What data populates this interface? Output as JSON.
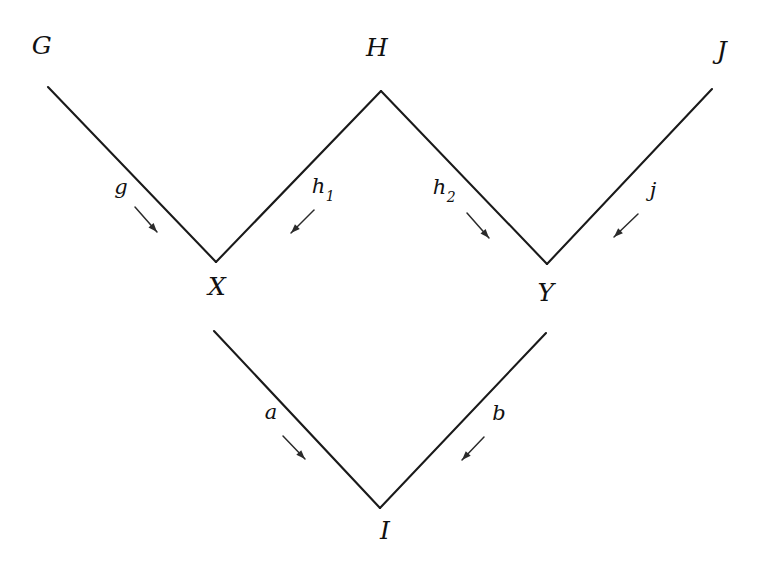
{
  "diagram": {
    "background_color": "#ffffff",
    "line_color": "#1a1a1a",
    "text_color": "#111111",
    "nodes": [
      {
        "id": "G",
        "label": "G",
        "x": 42,
        "y": 45
      },
      {
        "id": "H",
        "label": "H",
        "x": 377,
        "y": 47
      },
      {
        "id": "J",
        "label": "J",
        "x": 722,
        "y": 50
      },
      {
        "id": "X",
        "label": "X",
        "x": 217,
        "y": 286
      },
      {
        "id": "Y",
        "label": "Y",
        "x": 546,
        "y": 292
      },
      {
        "id": "I",
        "label": "I",
        "x": 385,
        "y": 530
      }
    ],
    "edges": [
      {
        "id": "g",
        "label": "g",
        "sublabel": "",
        "from": "G",
        "to": "X",
        "x1": 48,
        "y1": 87,
        "x2": 216,
        "y2": 262,
        "label_x": 121,
        "label_y": 187,
        "arrow_x1": 135,
        "arrow_y1": 207,
        "arrow_x2": 157,
        "arrow_y2": 232
      },
      {
        "id": "h1",
        "label": "h",
        "sublabel": "1",
        "from": "H",
        "to": "X",
        "x1": 381,
        "y1": 91,
        "x2": 216,
        "y2": 262,
        "label_x": 323,
        "label_y": 188,
        "arrow_x1": 314,
        "arrow_y1": 210,
        "arrow_x2": 291,
        "arrow_y2": 233
      },
      {
        "id": "h2",
        "label": "h",
        "sublabel": "2",
        "from": "H",
        "to": "Y",
        "x1": 381,
        "y1": 91,
        "x2": 547,
        "y2": 264,
        "label_x": 444,
        "label_y": 189,
        "arrow_x1": 467,
        "arrow_y1": 213,
        "arrow_x2": 489,
        "arrow_y2": 238
      },
      {
        "id": "j",
        "label": "j",
        "sublabel": "",
        "from": "J",
        "to": "Y",
        "x1": 712,
        "y1": 89,
        "x2": 547,
        "y2": 264,
        "label_x": 653,
        "label_y": 190,
        "arrow_x1": 638,
        "arrow_y1": 214,
        "arrow_x2": 614,
        "arrow_y2": 237
      },
      {
        "id": "a",
        "label": "a",
        "sublabel": "",
        "from": "X",
        "to": "I",
        "x1": 214,
        "y1": 331,
        "x2": 380,
        "y2": 508,
        "label_x": 271,
        "label_y": 412,
        "arrow_x1": 283,
        "arrow_y1": 436,
        "arrow_x2": 305,
        "arrow_y2": 459
      },
      {
        "id": "b",
        "label": "b",
        "sublabel": "",
        "from": "Y",
        "to": "I",
        "x1": 546,
        "y1": 333,
        "x2": 380,
        "y2": 508,
        "label_x": 499,
        "label_y": 413,
        "arrow_x1": 484,
        "arrow_y1": 437,
        "arrow_x2": 462,
        "arrow_y2": 460
      }
    ]
  }
}
